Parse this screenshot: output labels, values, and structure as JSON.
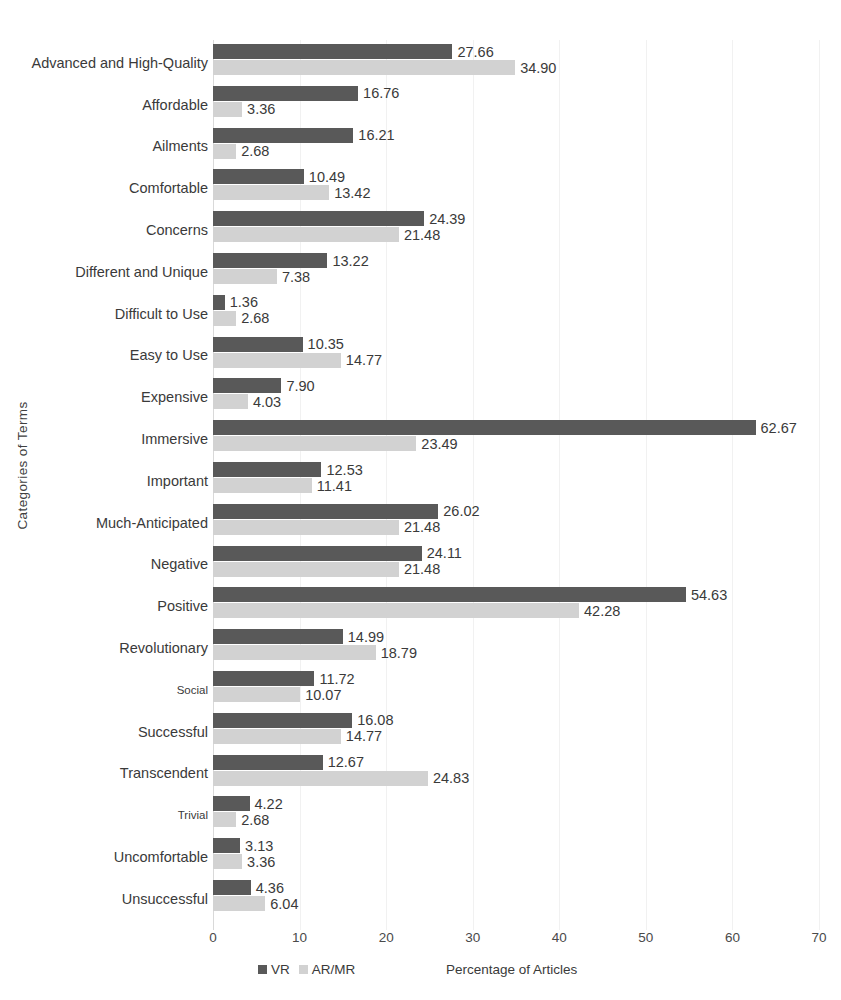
{
  "chart_data": {
    "type": "bar",
    "orientation": "horizontal",
    "title": "",
    "xlabel": "Percentage of Articles",
    "ylabel": "Categories of Terms",
    "xlim": [
      0,
      70
    ],
    "xticks": [
      0,
      10,
      20,
      30,
      40,
      50,
      60,
      70
    ],
    "xtick_labels": [
      "0",
      "10",
      "20",
      "30",
      "40",
      "50",
      "60",
      "70"
    ],
    "grid": true,
    "legend_position": "bottom",
    "colors": {
      "VR": "#595959",
      "AR/MR": "#d2d2d2"
    },
    "categories": [
      "Advanced and High-Quality",
      "Affordable",
      "Ailments",
      "Comfortable",
      "Concerns",
      "Different and Unique",
      "Difficult to Use",
      "Easy to Use",
      "Expensive",
      "Immersive",
      "Important",
      "Much-Anticipated",
      "Negative",
      "Positive",
      "Revolutionary",
      "Social",
      "Successful",
      "Transcendent",
      "Trivial",
      "Uncomfortable",
      "Unsuccessful"
    ],
    "series": [
      {
        "name": "VR",
        "values": [
          27.66,
          16.76,
          16.21,
          10.49,
          24.39,
          13.22,
          1.36,
          10.35,
          7.9,
          62.67,
          12.53,
          26.02,
          24.11,
          54.63,
          14.99,
          11.72,
          16.08,
          12.67,
          4.22,
          3.13,
          4.36
        ],
        "labels": [
          "27.66",
          "16.76",
          "16.21",
          "10.49",
          "24.39",
          "13.22",
          "1.36",
          "10.35",
          "7.90",
          "62.67",
          "12.53",
          "26.02",
          "24.11",
          "54.63",
          "14.99",
          "11.72",
          "16.08",
          "12.67",
          "4.22",
          "3.13",
          "4.36"
        ]
      },
      {
        "name": "AR/MR",
        "values": [
          34.9,
          3.36,
          2.68,
          13.42,
          21.48,
          7.38,
          2.68,
          14.77,
          4.03,
          23.49,
          11.41,
          21.48,
          21.48,
          42.28,
          18.79,
          10.07,
          14.77,
          24.83,
          2.68,
          3.36,
          6.04
        ],
        "labels": [
          "34.90",
          "3.36",
          "2.68",
          "13.42",
          "21.48",
          "7.38",
          "2.68",
          "14.77",
          "4.03",
          "23.49",
          "11.41",
          "21.48",
          "21.48",
          "42.28",
          "18.79",
          "10.07",
          "14.77",
          "24.83",
          "2.68",
          "3.36",
          "6.04"
        ]
      }
    ]
  },
  "legend": {
    "items": [
      {
        "label": "VR",
        "color": "#595959"
      },
      {
        "label": "AR/MR",
        "color": "#d2d2d2"
      }
    ]
  },
  "axes": {
    "x_title": "Percentage of Articles",
    "y_title": "Categories of Terms"
  }
}
